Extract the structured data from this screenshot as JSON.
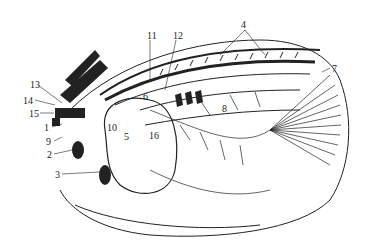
{
  "figure": {
    "type": "anatomical line drawing",
    "labels": [
      {
        "id": "1",
        "x": 44,
        "y": 123
      },
      {
        "id": "2",
        "x": 47,
        "y": 150
      },
      {
        "id": "3",
        "x": 55,
        "y": 170
      },
      {
        "id": "4",
        "x": 241,
        "y": 20
      },
      {
        "id": "5",
        "x": 124,
        "y": 132
      },
      {
        "id": "6",
        "x": 143,
        "y": 92
      },
      {
        "id": "7",
        "x": 332,
        "y": 64
      },
      {
        "id": "8",
        "x": 222,
        "y": 104
      },
      {
        "id": "9",
        "x": 46,
        "y": 137
      },
      {
        "id": "10",
        "x": 107,
        "y": 123
      },
      {
        "id": "11",
        "x": 147,
        "y": 31
      },
      {
        "id": "12",
        "x": 173,
        "y": 31
      },
      {
        "id": "13",
        "x": 30,
        "y": 80
      },
      {
        "id": "14",
        "x": 23,
        "y": 96
      },
      {
        "id": "15",
        "x": 29,
        "y": 109
      },
      {
        "id": "16",
        "x": 149,
        "y": 131
      }
    ]
  }
}
